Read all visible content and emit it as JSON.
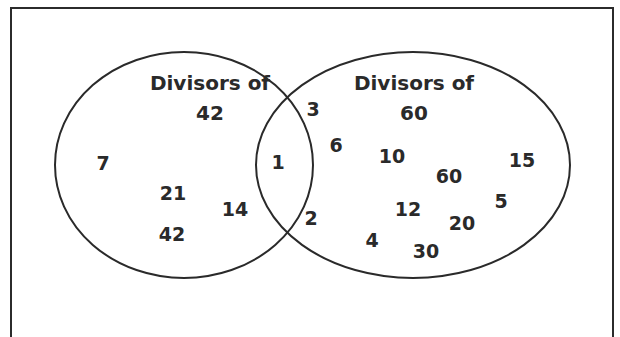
{
  "diagram": {
    "type": "venn",
    "sets": [
      {
        "id": "A",
        "title_line1": "Divisors of",
        "title_line2": "42",
        "only": [
          "7",
          "21",
          "14",
          "42"
        ]
      },
      {
        "id": "B",
        "title_line1": "Divisors of",
        "title_line2": "60",
        "only": [
          "10",
          "60",
          "15",
          "12",
          "5",
          "20",
          "4",
          "30"
        ]
      }
    ],
    "intersection": [
      "3",
      "6",
      "1",
      "2"
    ],
    "colors": {
      "stroke": "#2a2a2a",
      "text": "#2a2a2a",
      "background": "#ffffff"
    }
  }
}
